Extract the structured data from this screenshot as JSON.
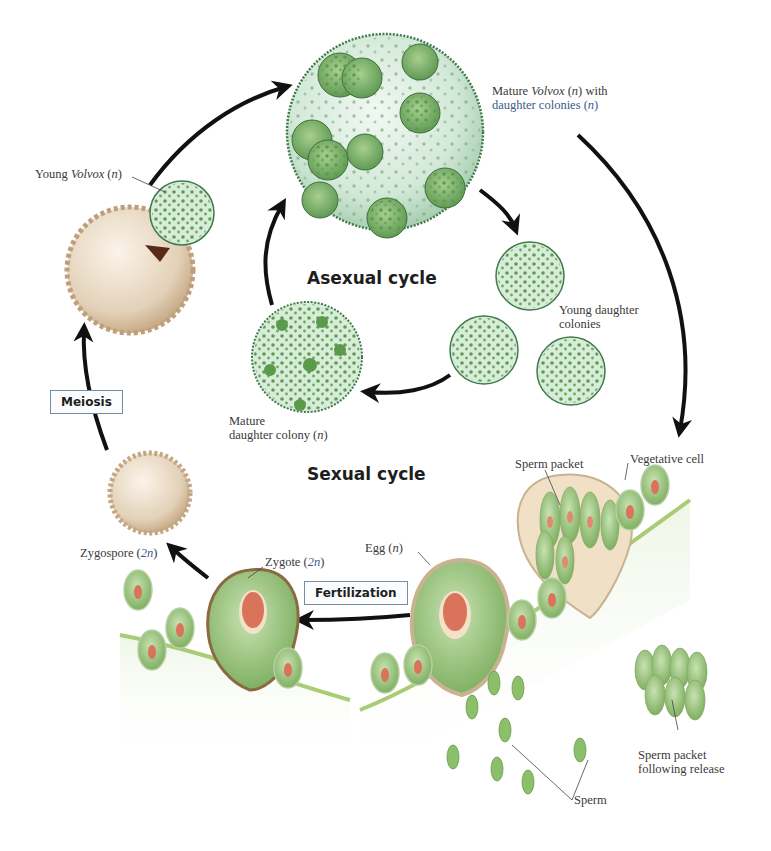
{
  "diagram": {
    "colors": {
      "arrow": "#111111",
      "colony_fill": "#d7ecd9",
      "colony_edge": "#3f7a4a",
      "cell_green": "#8cbf6a",
      "nucleus": "#d9735a",
      "zygospore": "#e6d6bf",
      "surface_line": "#a9cc74"
    },
    "cycles": {
      "asexual": "Asexual cycle",
      "sexual": "Sexual cycle"
    },
    "process_boxes": {
      "meiosis": "Meiosis",
      "fertilization": "Fertilization"
    },
    "labels": {
      "mature_volvox": {
        "a": "Mature ",
        "b": "Volvox",
        "c": " (",
        "d": "n",
        "e": ") with",
        "line2a": "daughter colonies (",
        "line2b": "n",
        "line2c": ")"
      },
      "young_volvox": {
        "a": "Young ",
        "b": "Volvox",
        "c": " (",
        "d": "n",
        "e": ")"
      },
      "young_daughter": {
        "line1": "Young daughter",
        "line2": "colonies"
      },
      "mature_daughter": {
        "line1": "Mature",
        "line2a": "daughter colony (",
        "line2b": "n",
        "line2c": ")"
      },
      "zygospore": {
        "a": "Zygospore (",
        "b": "2n",
        "c": ")"
      },
      "zygote": {
        "a": "Zygote (",
        "b": "2n",
        "c": ")"
      },
      "egg": {
        "a": "Egg (",
        "b": "n",
        "c": ")"
      },
      "sperm_packet": "Sperm packet",
      "vegetative_cell": "Vegetative cell",
      "sperm_packet_release": {
        "line1": "Sperm packet",
        "line2": "following release"
      },
      "sperm": "Sperm"
    }
  }
}
